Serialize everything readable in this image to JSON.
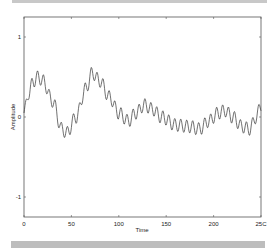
{
  "chart_data": {
    "type": "line",
    "title": "",
    "xlabel": "Time",
    "ylabel": "Amplitude",
    "xlim": [
      0,
      250
    ],
    "ylim": [
      -1.25,
      1.25
    ],
    "xticks": [
      0,
      50,
      100,
      150,
      200,
      250
    ],
    "xtick_labels": [
      "0",
      "50",
      "100",
      "150",
      "200",
      "25C"
    ],
    "yticks": [
      1,
      0,
      -1
    ],
    "ytick_labels": [
      "1",
      "0",
      "-1"
    ],
    "grid": false,
    "legend": null,
    "series": [
      {
        "name": "signal",
        "color": "#333333",
        "envelope_x": [
          0,
          5,
          10,
          15,
          20,
          30,
          40,
          45,
          55,
          65,
          72,
          80,
          90,
          100,
          110,
          118,
          127,
          135,
          145,
          160,
          175,
          185,
          195,
          205,
          212,
          220,
          230,
          238,
          245,
          250
        ],
        "envelope_y": [
          0.05,
          0.3,
          0.45,
          0.5,
          0.45,
          0.2,
          -0.15,
          -0.2,
          0.0,
          0.35,
          0.55,
          0.45,
          0.25,
          0.05,
          -0.05,
          0.05,
          0.15,
          0.1,
          0.0,
          -0.1,
          -0.12,
          -0.15,
          -0.05,
          0.05,
          0.08,
          0.0,
          -0.12,
          -0.15,
          0.0,
          0.15
        ],
        "ripple_amplitude": 0.08,
        "ripple_period": 6.3
      }
    ]
  }
}
